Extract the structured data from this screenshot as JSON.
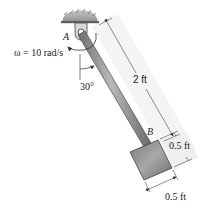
{
  "figure": {
    "type": "pendulum-rod-with-block",
    "labels": {
      "pin": "A",
      "joint": "B",
      "omega": "ω = 10 rad/s",
      "angle": "30°",
      "rod_length": "2 ft",
      "block_height": "0.5 ft",
      "block_width": "0.5 ft"
    },
    "colors": {
      "ceiling": "#9a9a9a",
      "rod": "#8c8c8c",
      "rod_edge": "#555555",
      "block_light": "#b5b5b5",
      "block_dark": "#6e6e6e",
      "dimension_line": "#444444",
      "shadow": "#eaeaea"
    }
  }
}
